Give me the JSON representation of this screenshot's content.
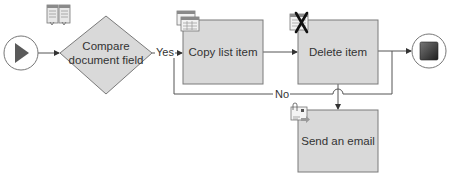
{
  "workflow": {
    "start": {
      "name": "Start",
      "icon": "play-icon"
    },
    "end": {
      "name": "End",
      "icon": "stop-icon"
    },
    "nodes": [
      {
        "id": "compare",
        "type": "condition",
        "label": "Compare\ndocument field",
        "line1": "Compare",
        "line2": "document field",
        "icon": "compare-document-icon"
      },
      {
        "id": "copy",
        "type": "action",
        "label": "Copy list item",
        "icon": "list-item-icon"
      },
      {
        "id": "delete",
        "type": "action",
        "label": "Delete item",
        "icon": "delete-list-item-icon"
      },
      {
        "id": "email",
        "type": "action",
        "label": "Send an email",
        "icon": "email-icon"
      }
    ],
    "edges": [
      {
        "from": "start",
        "to": "compare",
        "label": ""
      },
      {
        "from": "compare",
        "to": "copy",
        "label": "Yes"
      },
      {
        "from": "compare",
        "to": "email",
        "label": "No"
      },
      {
        "from": "copy",
        "to": "delete",
        "label": ""
      },
      {
        "from": "delete",
        "to": "end",
        "label": ""
      },
      {
        "from": "email",
        "to": "end",
        "label": ""
      }
    ],
    "labels": {
      "yes": "Yes",
      "no": "No"
    },
    "colors": {
      "node_fill": "#d9d9d9",
      "node_stroke": "#7a7a7a",
      "line": "#555555",
      "end_fill": "#3a3a3a",
      "start_fill": "#555555"
    }
  }
}
